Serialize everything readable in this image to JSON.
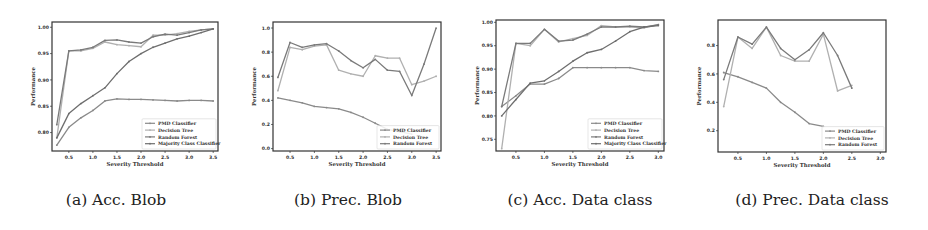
{
  "chart_data": [
    {
      "id": "a",
      "type": "line",
      "caption": "(a) Acc. Blob",
      "title": "",
      "xlabel": "Severity Threshold",
      "ylabel": "Performance",
      "xlim": [
        0.15,
        3.6
      ],
      "ylim": [
        0.765,
        1.01
      ],
      "xticks": [
        0.5,
        1.0,
        1.5,
        2.0,
        2.5,
        3.0,
        3.5
      ],
      "yticks": [
        0.8,
        0.85,
        0.9,
        0.95,
        1.0
      ],
      "grid": false,
      "legend_position": "lower right",
      "x": [
        0.25,
        0.5,
        0.75,
        1.0,
        1.25,
        1.5,
        1.75,
        2.0,
        2.25,
        2.5,
        2.75,
        3.0,
        3.25,
        3.5
      ],
      "series": [
        {
          "name": "PMD Classifier",
          "color": "#8a8a8a",
          "values": [
            0.776,
            0.81,
            0.828,
            0.842,
            0.86,
            0.864,
            0.863,
            0.863,
            0.862,
            0.861,
            0.86,
            0.861,
            0.861,
            0.86
          ]
        },
        {
          "name": "Decision Tree",
          "color": "#b0b0b0",
          "values": [
            0.79,
            0.955,
            0.955,
            0.96,
            0.972,
            0.967,
            0.965,
            0.963,
            0.985,
            0.985,
            0.988,
            0.992,
            0.995,
            0.997
          ]
        },
        {
          "name": "Random Forest",
          "color": "#7a7a7a",
          "values": [
            0.815,
            0.955,
            0.957,
            0.962,
            0.975,
            0.976,
            0.972,
            0.97,
            0.982,
            0.987,
            0.985,
            0.99,
            0.995,
            0.997
          ]
        },
        {
          "name": "Majority Class Classifier",
          "color": "#6e6e6e",
          "values": [
            0.79,
            0.836,
            0.855,
            0.87,
            0.885,
            0.912,
            0.935,
            0.95,
            0.962,
            0.97,
            0.978,
            0.983,
            0.99,
            0.997
          ]
        }
      ]
    },
    {
      "id": "b",
      "type": "line",
      "caption": "(b) Prec. Blob",
      "title": "",
      "xlabel": "Severity Threshold",
      "ylabel": "Performance",
      "xlim": [
        0.15,
        3.6
      ],
      "ylim": [
        -0.02,
        1.05
      ],
      "xticks": [
        0.5,
        1.0,
        1.5,
        2.0,
        2.5,
        3.0,
        3.5
      ],
      "yticks": [
        0.0,
        0.2,
        0.4,
        0.6,
        0.8,
        1.0
      ],
      "grid": false,
      "legend_position": "lower right",
      "x": [
        0.25,
        0.5,
        0.75,
        1.0,
        1.25,
        1.5,
        1.75,
        2.0,
        2.25,
        2.5,
        2.75,
        3.0,
        3.25,
        3.5
      ],
      "series": [
        {
          "name": "PMD Classifier",
          "color": "#8a8a8a",
          "values": [
            0.42,
            0.4,
            0.38,
            0.35,
            0.34,
            0.33,
            0.3,
            0.26,
            0.21,
            0.16,
            0.14,
            0.12,
            null,
            null
          ]
        },
        {
          "name": "Decision Tree",
          "color": "#b0b0b0",
          "values": [
            0.48,
            0.84,
            0.82,
            0.85,
            0.86,
            0.65,
            0.62,
            0.6,
            0.77,
            0.75,
            0.75,
            0.53,
            0.56,
            0.6
          ]
        },
        {
          "name": "Random Forest",
          "color": "#7a7a7a",
          "values": [
            0.59,
            0.88,
            0.84,
            0.86,
            0.87,
            0.81,
            0.73,
            0.67,
            0.74,
            0.65,
            0.64,
            0.44,
            0.7,
            1.0
          ]
        }
      ]
    },
    {
      "id": "c",
      "type": "line",
      "caption": "(c) Acc. Data class",
      "title": "",
      "xlabel": "Severity Threshold",
      "ylabel": "Performance",
      "xlim": [
        0.15,
        3.1
      ],
      "ylim": [
        0.725,
        1.005
      ],
      "xticks": [
        0.5,
        1.0,
        1.5,
        2.0,
        2.5,
        3.0
      ],
      "yticks": [
        0.75,
        0.8,
        0.85,
        0.9,
        0.95,
        1.0
      ],
      "grid": false,
      "legend_position": "lower right",
      "x": [
        0.25,
        0.5,
        0.75,
        1.0,
        1.25,
        1.5,
        1.75,
        2.0,
        2.25,
        2.5,
        2.75,
        3.0
      ],
      "series": [
        {
          "name": "PMD Classifier",
          "color": "#8a8a8a",
          "values": [
            0.82,
            0.843,
            0.868,
            0.868,
            0.88,
            0.903,
            0.903,
            0.903,
            0.903,
            0.903,
            0.897,
            0.895
          ]
        },
        {
          "name": "Decision Tree",
          "color": "#b0b0b0",
          "values": [
            0.73,
            0.955,
            0.95,
            0.985,
            0.958,
            0.965,
            0.972,
            0.993,
            0.99,
            0.99,
            0.988,
            0.995
          ]
        },
        {
          "name": "Random Forest",
          "color": "#7a7a7a",
          "values": [
            0.82,
            0.955,
            0.955,
            0.985,
            0.96,
            0.962,
            0.975,
            0.99,
            0.99,
            0.992,
            0.99,
            0.995
          ]
        },
        {
          "name": "Majority Class Classifier",
          "color": "#6e6e6e",
          "values": [
            0.8,
            0.835,
            0.87,
            0.875,
            0.895,
            0.917,
            0.935,
            0.942,
            0.96,
            0.98,
            0.99,
            0.993
          ]
        }
      ]
    },
    {
      "id": "d",
      "type": "line",
      "caption": "(d) Prec. Data class",
      "title": "",
      "xlabel": "Severity Threshold",
      "ylabel": "Performance",
      "xlim": [
        0.15,
        3.1
      ],
      "ylim": [
        0.05,
        0.98
      ],
      "xticks": [
        0.5,
        1.0,
        1.5,
        2.0,
        2.5,
        3.0
      ],
      "yticks": [
        0.2,
        0.4,
        0.6,
        0.8
      ],
      "grid": false,
      "legend_position": "lower right",
      "x": [
        0.25,
        0.5,
        0.75,
        1.0,
        1.25,
        1.5,
        1.75,
        2.0,
        2.25,
        2.5,
        2.75,
        3.0
      ],
      "series": [
        {
          "name": "PMD Classifier",
          "color": "#8a8a8a",
          "values": [
            0.61,
            0.58,
            0.54,
            0.5,
            0.4,
            0.33,
            0.25,
            0.23,
            null,
            null,
            null,
            null
          ]
        },
        {
          "name": "Decision Tree",
          "color": "#b0b0b0",
          "values": [
            0.37,
            0.86,
            0.78,
            0.93,
            0.73,
            0.69,
            0.69,
            0.88,
            0.48,
            0.52,
            null,
            null
          ]
        },
        {
          "name": "Random Forest",
          "color": "#7a7a7a",
          "values": [
            0.56,
            0.86,
            0.81,
            0.93,
            0.78,
            0.7,
            0.77,
            0.89,
            0.73,
            0.5,
            null,
            null
          ]
        }
      ]
    }
  ],
  "captions": {
    "a": "(a) Acc. Blob",
    "b": "(b) Prec. Blob",
    "c": "(c) Acc. Data class",
    "d": "(d) Prec. Data class"
  }
}
